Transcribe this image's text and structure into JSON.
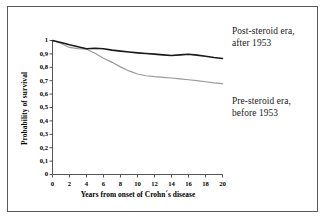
{
  "chart_data": {
    "type": "line",
    "title": "",
    "xlabel": "Years from onset of Crohn´s disease",
    "ylabel": "Probability of survival",
    "xlim": [
      0,
      20
    ],
    "ylim": [
      0,
      1
    ],
    "grid": false,
    "legend_position": "right-annotations",
    "xticks": [
      "0",
      "2",
      "4",
      "6",
      "8",
      "10",
      "12",
      "14",
      "16",
      "18",
      "20"
    ],
    "xtick_values": [
      0,
      2,
      4,
      6,
      8,
      10,
      12,
      14,
      16,
      18,
      20
    ],
    "yticks": [
      "0",
      "0,1",
      "0,2",
      "0,3",
      "0,4",
      "0,5",
      "0,6",
      "0,7",
      "0,8",
      "0,9",
      "1"
    ],
    "ytick_values": [
      0,
      0.1,
      0.2,
      0.3,
      0.4,
      0.5,
      0.6,
      0.7,
      0.8,
      0.9,
      1
    ],
    "x": [
      0,
      1,
      2,
      3,
      4,
      5,
      6,
      7,
      8,
      9,
      10,
      11,
      12,
      13,
      14,
      15,
      16,
      17,
      18,
      19,
      20
    ],
    "series": [
      {
        "name": "Post-steroid era, after 1953",
        "color": "#1a1a1a",
        "width": 1.6,
        "values": [
          1.0,
          0.985,
          0.968,
          0.953,
          0.938,
          0.942,
          0.938,
          0.928,
          0.921,
          0.914,
          0.908,
          0.903,
          0.898,
          0.893,
          0.888,
          0.893,
          0.897,
          0.891,
          0.882,
          0.873,
          0.866
        ]
      },
      {
        "name": "Pre-steroid era, before 1953",
        "color": "#9a9a9a",
        "width": 1.2,
        "values": [
          1.0,
          0.978,
          0.948,
          0.94,
          0.935,
          0.905,
          0.868,
          0.837,
          0.803,
          0.773,
          0.75,
          0.737,
          0.73,
          0.725,
          0.72,
          0.713,
          0.707,
          0.7,
          0.692,
          0.684,
          0.678
        ]
      }
    ],
    "annotations": [
      {
        "id": "post-steroid",
        "lines": [
          "Post-steroid era,",
          "after 1953"
        ],
        "target_series": "Post-steroid era, after 1953"
      },
      {
        "id": "pre-steroid",
        "lines": [
          "Pre-steroid era,",
          "before 1953"
        ],
        "target_series": "Pre-steroid era, before 1953"
      }
    ],
    "colors": {
      "axis": "#555555",
      "frame": "#5a5a5a",
      "background": "#ffffff",
      "series_post": "#1a1a1a",
      "series_pre": "#9a9a9a",
      "text": "#000000"
    }
  }
}
